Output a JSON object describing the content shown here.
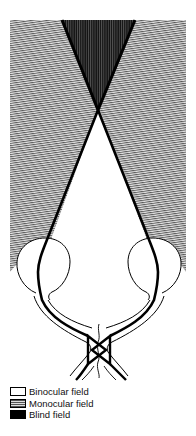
{
  "figure": {
    "regions": [
      {
        "id": "binocular",
        "label": "Binocular field",
        "fill": "#ffffff"
      },
      {
        "id": "monocular",
        "label": "Monocular field",
        "fill": "hatched-gray"
      },
      {
        "id": "blind",
        "label": "Blind field",
        "fill": "#000000"
      }
    ]
  },
  "legend": {
    "items": [
      {
        "label": "Binocular field",
        "swatch": "white"
      },
      {
        "label": "Monocular field",
        "swatch": "hatched"
      },
      {
        "label": "Blind field",
        "swatch": "black"
      }
    ]
  }
}
